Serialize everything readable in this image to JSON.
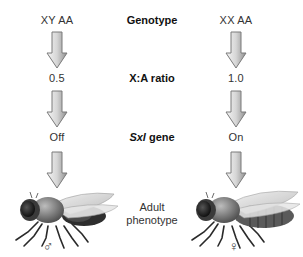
{
  "diagram": {
    "row_labels": {
      "genotype": "Genotype",
      "ratio": "X:A ratio",
      "gene_italic": "Sxl",
      "gene_rest": " gene",
      "phenotype_line1": "Adult",
      "phenotype_line2": "phenotype"
    },
    "columns": [
      {
        "name": "male",
        "genotype": "XY  AA",
        "ratio": "0.5",
        "sxl_state": "Off",
        "sex_symbol": "♂",
        "fly_icon": "male-fruit-fly"
      },
      {
        "name": "female",
        "genotype": "XX  AA",
        "ratio": "1.0",
        "sxl_state": "On",
        "sex_symbol": "♀",
        "fly_icon": "female-fruit-fly"
      }
    ],
    "colors": {
      "arrow_fill_light": "#f2f2f2",
      "arrow_fill_dark": "#9a9a9a",
      "arrow_stroke": "#7a7a7a",
      "fly_body": "#3a3a3a",
      "fly_wing": "#d8d8d8"
    }
  }
}
